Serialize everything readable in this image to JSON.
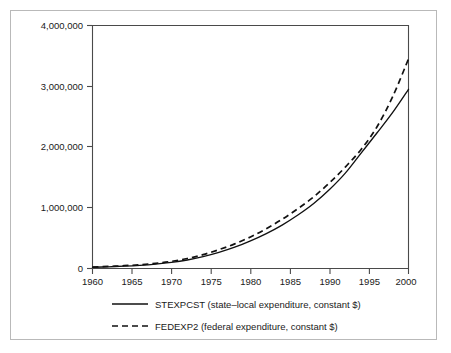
{
  "chart_data": {
    "type": "line",
    "title": "",
    "subtitle": "",
    "xlabel": "",
    "ylabel": "",
    "xlim": [
      1960,
      2000
    ],
    "ylim": [
      0,
      4000000
    ],
    "grid": false,
    "legend_position": "below-axis-left",
    "x_ticks": [
      "1960",
      "1965",
      "1970",
      "1975",
      "1980",
      "1985",
      "1990",
      "1995",
      "2000"
    ],
    "x_tick_values": [
      1960,
      1965,
      1970,
      1975,
      1980,
      1985,
      1990,
      1995,
      2000
    ],
    "y_ticks": [
      "0",
      "1,000,000",
      "2,000,000",
      "3,000,000",
      "4,000,000"
    ],
    "y_tick_values": [
      0,
      1000000,
      2000000,
      3000000,
      4000000
    ],
    "x": [
      1960,
      1962,
      1964,
      1966,
      1968,
      1970,
      1972,
      1974,
      1976,
      1978,
      1980,
      1982,
      1984,
      1986,
      1988,
      1990,
      1992,
      1994,
      1996,
      1998,
      2000
    ],
    "series": [
      {
        "name": "STEXPCST",
        "label": "STEXPCST (state–local expenditure, constant $)",
        "style": "solid",
        "color": "#111111",
        "values": [
          20000,
          28000,
          38000,
          52000,
          72000,
          100000,
          140000,
          195000,
          265000,
          350000,
          455000,
          575000,
          715000,
          880000,
          1070000,
          1300000,
          1570000,
          1900000,
          2230000,
          2570000,
          2950000
        ]
      },
      {
        "name": "FEDEXP2",
        "label": "FEDEXP2 (federal expenditure, constant $)",
        "style": "dashed",
        "color": "#111111",
        "values": [
          25000,
          34000,
          46000,
          62000,
          86000,
          118000,
          165000,
          228000,
          310000,
          405000,
          520000,
          655000,
          810000,
          985000,
          1180000,
          1410000,
          1670000,
          1960000,
          2330000,
          2830000,
          3450000
        ]
      }
    ],
    "legend": [
      {
        "sample": "solid-line",
        "text": "STEXPCST (state–local expenditure, constant $)"
      },
      {
        "sample": "dashed-line",
        "text": "FEDEXP2 (federal expenditure, constant $)"
      }
    ]
  }
}
